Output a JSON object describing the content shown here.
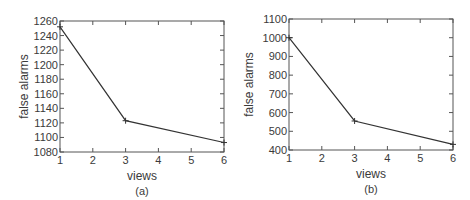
{
  "chart_data": [
    {
      "type": "line",
      "panel_label": "(a)",
      "title": "",
      "xlabel": "views",
      "ylabel": "false alarms",
      "x": [
        1,
        3,
        6
      ],
      "values": [
        1252,
        1123,
        1093
      ],
      "xlim": [
        1,
        6
      ],
      "ylim": [
        1080,
        1260
      ],
      "xticks": [
        1,
        2,
        3,
        4,
        5,
        6
      ],
      "yticks": [
        1080,
        1100,
        1120,
        1140,
        1160,
        1180,
        1200,
        1220,
        1240,
        1260
      ],
      "marker": "+",
      "grid": false,
      "legend": null
    },
    {
      "type": "line",
      "panel_label": "(b)",
      "title": "",
      "xlabel": "views",
      "ylabel": "false alarms",
      "x": [
        1,
        3,
        6
      ],
      "values": [
        1000,
        555,
        430
      ],
      "xlim": [
        1,
        6
      ],
      "ylim": [
        400,
        1100
      ],
      "xticks": [
        1,
        2,
        3,
        4,
        5,
        6
      ],
      "yticks": [
        400,
        500,
        600,
        700,
        800,
        900,
        1000,
        1100
      ],
      "marker": "+",
      "grid": false,
      "legend": null
    }
  ],
  "colors": {
    "axis": "#555555",
    "line": "#333333",
    "text": "#3a3a3a"
  }
}
